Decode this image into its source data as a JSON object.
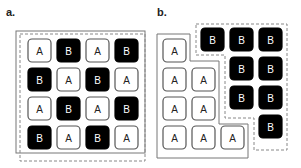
{
  "panels": [
    {
      "label": "a.",
      "grid": [
        [
          "A",
          "B",
          "A",
          "B"
        ],
        [
          "B",
          "A",
          "B",
          "A"
        ],
        [
          "A",
          "B",
          "A",
          "B"
        ],
        [
          "B",
          "A",
          "B",
          "A"
        ]
      ]
    },
    {
      "label": "b.",
      "group_a": [
        "A",
        "A",
        "A",
        "A",
        "A",
        "A",
        "A",
        "A"
      ],
      "group_b": [
        "B",
        "B",
        "B",
        "B",
        "B",
        "B",
        "B",
        "B"
      ]
    }
  ],
  "colors": {
    "a_fill": "#ffffff",
    "b_fill": "#000000",
    "outline": "#555555"
  }
}
